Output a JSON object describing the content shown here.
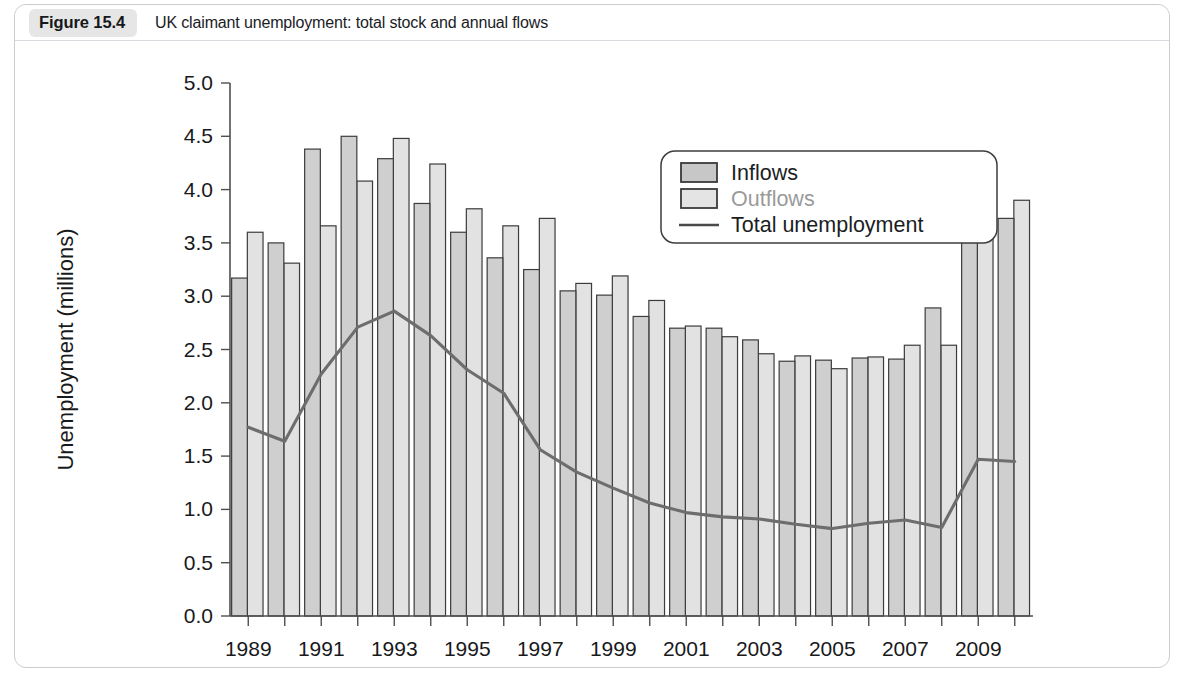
{
  "figure": {
    "number": "Figure 15.4",
    "title": "UK claimant unemployment: total stock and annual flows"
  },
  "chart_data": {
    "type": "bar",
    "title": "UK claimant unemployment: total stock and annual flows",
    "xlabel": "",
    "ylabel": "Unemployment (millions)",
    "ylim": [
      0.0,
      5.0
    ],
    "ytick_labels": [
      "0.0",
      "0.5",
      "1.0",
      "1.5",
      "2.0",
      "2.5",
      "3.0",
      "3.5",
      "4.0",
      "4.5",
      "5.0"
    ],
    "ytick_values": [
      0.0,
      0.5,
      1.0,
      1.5,
      2.0,
      2.5,
      3.0,
      3.5,
      4.0,
      4.5,
      5.0
    ],
    "grid": false,
    "legend_position": "top-right",
    "legend": [
      "Inflows",
      "Outflows",
      "Total unemployment"
    ],
    "categories": [
      1989,
      1990,
      1991,
      1992,
      1993,
      1994,
      1995,
      1996,
      1997,
      1998,
      1999,
      2000,
      2001,
      2002,
      2003,
      2004,
      2005,
      2006,
      2007,
      2008,
      2009,
      2010
    ],
    "xtick_labels": [
      "1989",
      "1991",
      "1993",
      "1995",
      "1997",
      "1999",
      "2001",
      "2003",
      "2005",
      "2007",
      "2009"
    ],
    "xtick_values": [
      1989,
      1991,
      1993,
      1995,
      1997,
      1999,
      2001,
      2003,
      2005,
      2007,
      2009
    ],
    "series": [
      {
        "name": "Inflows",
        "type": "bar",
        "color": "#cfcfcf",
        "values": [
          3.17,
          3.5,
          4.38,
          4.5,
          4.29,
          3.87,
          3.6,
          3.36,
          3.25,
          3.05,
          3.01,
          2.81,
          2.7,
          2.7,
          2.59,
          2.39,
          2.4,
          2.42,
          2.41,
          2.89,
          4.12,
          3.73
        ]
      },
      {
        "name": "Outflows",
        "type": "bar",
        "color": "#e2e2e2",
        "values": [
          3.6,
          3.31,
          3.66,
          4.08,
          4.48,
          4.24,
          3.82,
          3.66,
          3.73,
          3.12,
          3.19,
          2.96,
          2.72,
          2.62,
          2.46,
          2.44,
          2.32,
          2.43,
          2.54,
          2.54,
          3.67,
          3.9
        ]
      },
      {
        "name": "Total unemployment",
        "type": "line",
        "color": "#6d6d6d",
        "values": [
          1.77,
          1.64,
          2.27,
          2.71,
          2.86,
          2.63,
          2.31,
          2.09,
          1.56,
          1.35,
          1.2,
          1.06,
          0.97,
          0.93,
          0.91,
          0.86,
          0.82,
          0.87,
          0.9,
          0.83,
          1.47,
          1.45
        ]
      }
    ]
  }
}
